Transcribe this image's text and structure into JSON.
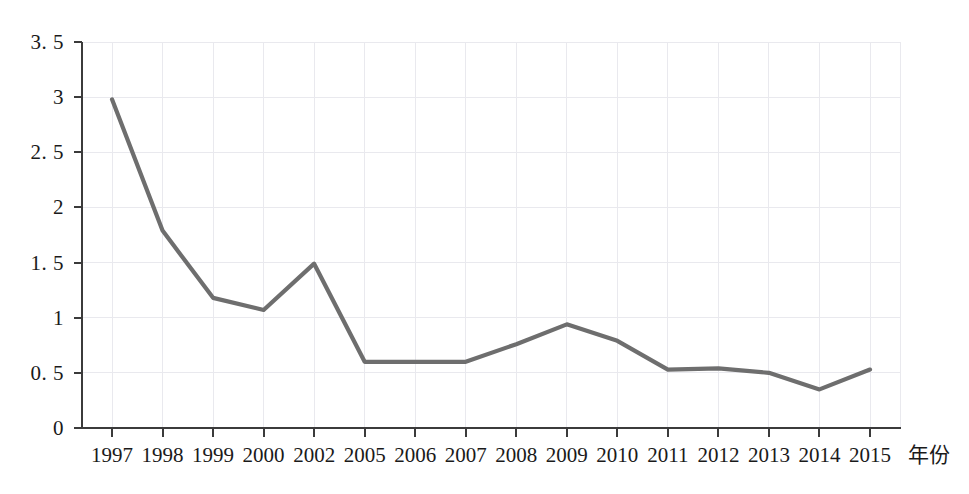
{
  "chart_data": {
    "type": "line",
    "title": "",
    "subtitle": "",
    "xlabel": "年份",
    "ylabel": "",
    "categories": [
      "1997",
      "1998",
      "1999",
      "2000",
      "2002",
      "2005",
      "2006",
      "2007",
      "2008",
      "2009",
      "2010",
      "2011",
      "2012",
      "2013",
      "2014",
      "2015"
    ],
    "values": [
      2.98,
      1.79,
      1.18,
      1.07,
      1.49,
      0.6,
      0.6,
      0.6,
      0.76,
      0.94,
      0.79,
      0.53,
      0.54,
      0.5,
      0.35,
      0.53
    ],
    "series": [
      {
        "name": "",
        "color": "#6e6e6e",
        "values": [
          2.98,
          1.79,
          1.18,
          1.07,
          1.49,
          0.6,
          0.6,
          0.6,
          0.76,
          0.94,
          0.79,
          0.53,
          0.54,
          0.5,
          0.35,
          0.53
        ]
      }
    ],
    "ylim": [
      0,
      3.5
    ],
    "yticks": [
      0,
      0.5,
      1,
      1.5,
      2,
      2.5,
      3,
      3.5
    ],
    "ytick_labels": [
      "0",
      "0. 5",
      "1",
      "1. 5",
      "2",
      "2. 5",
      "3",
      "3. 5"
    ],
    "xtick_labels": [
      "1997",
      "1998",
      "1999",
      "2000",
      "2002",
      "2005",
      "2006",
      "2007",
      "2008",
      "2009",
      "2010",
      "2011",
      "2012",
      "2013",
      "2014",
      "2015"
    ],
    "grid": true,
    "grid_color": "#e9e9ee",
    "legend": false,
    "legend_position": "none",
    "markers": false,
    "line_color": "#6e6e6e",
    "background_color": "#ffffff",
    "axis_color": "#3b3b3b",
    "annotations": []
  },
  "axis": {
    "x_title": "年份",
    "y_title": ""
  }
}
